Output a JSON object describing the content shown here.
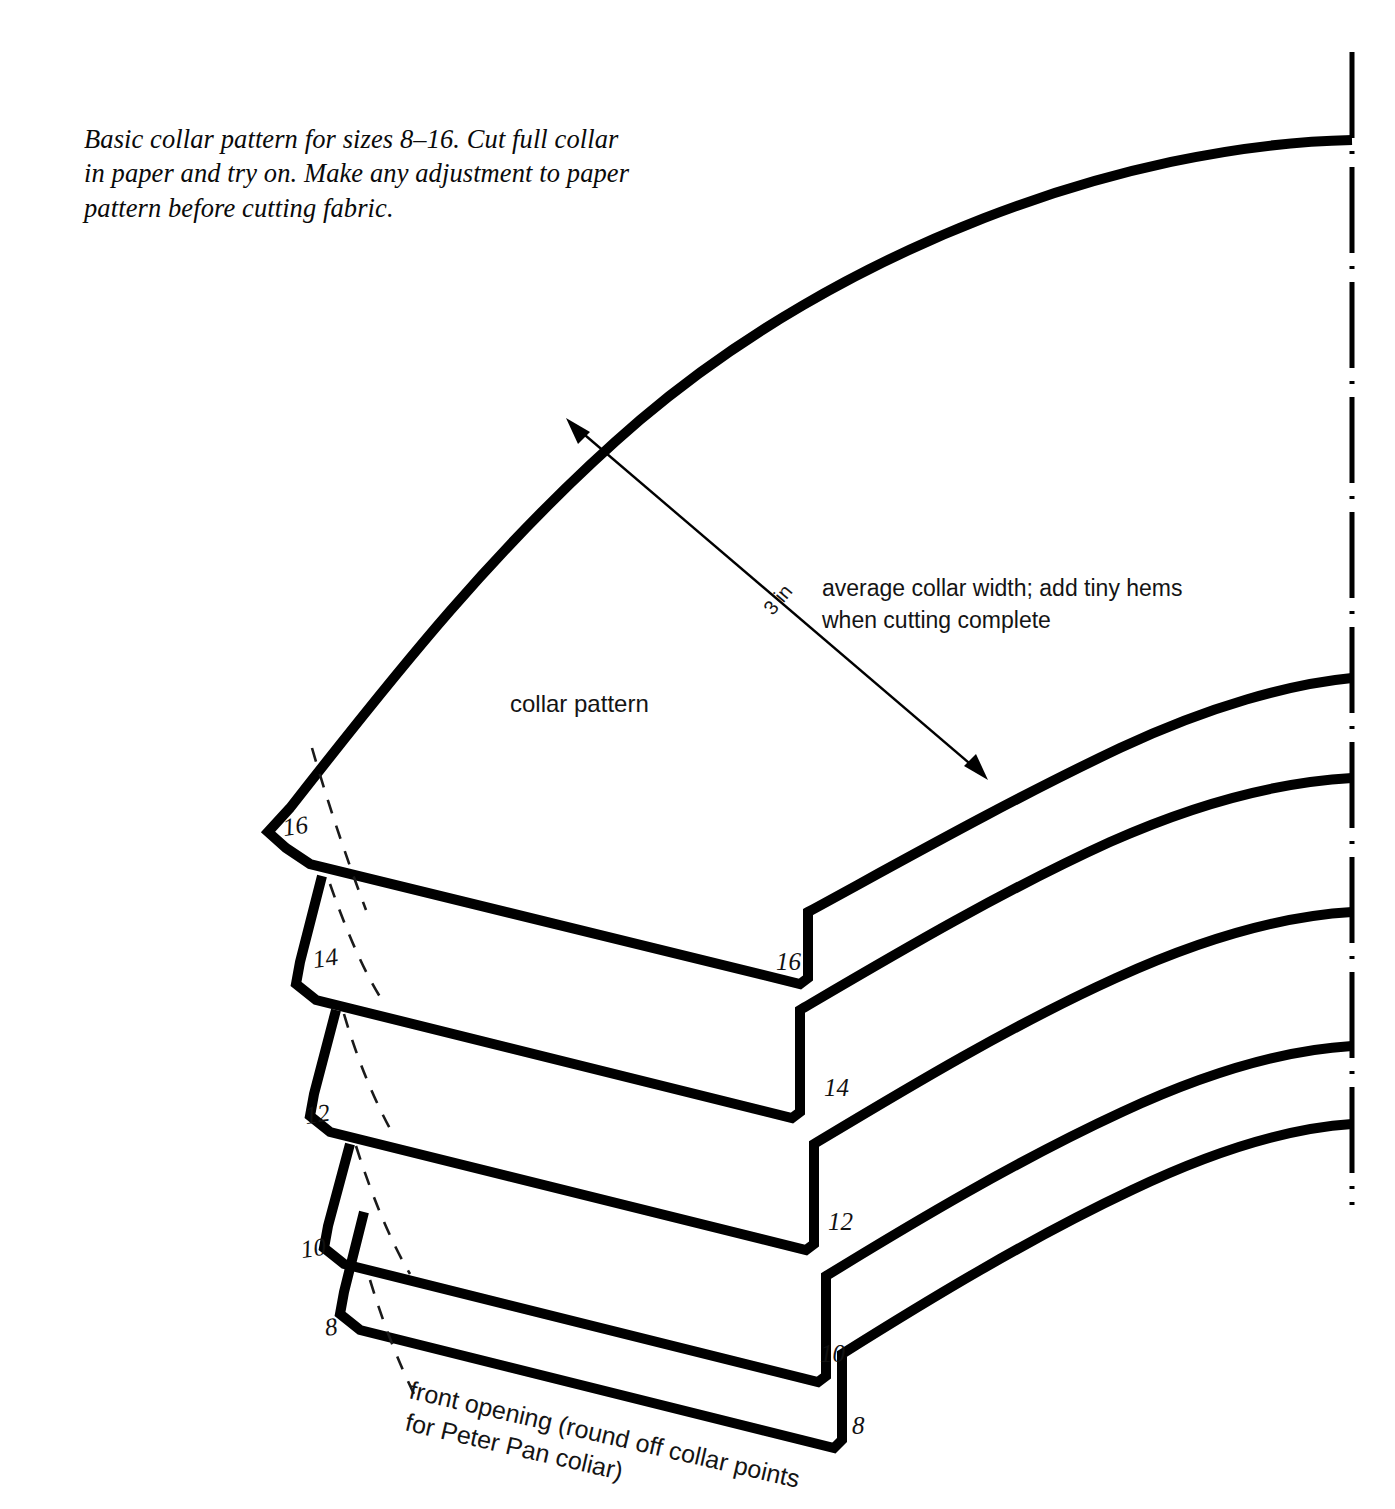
{
  "document": {
    "type": "sewing-pattern-diagram",
    "background_color": "#ffffff",
    "ink_color": "#000000"
  },
  "caption": {
    "line1": "Basic collar pattern for sizes 8–16. Cut full collar",
    "line2": "in paper and try on. Make any adjustment to paper",
    "line3": "pattern before cutting fabric."
  },
  "labels": {
    "pattern_name": "collar pattern",
    "dimension": "3 in",
    "annotation_line1": "average collar width; add tiny hems",
    "annotation_line2": "when cutting complete",
    "front_opening_line1": "front opening (round off collar points",
    "front_opening_line2": "for Peter Pan coliar)"
  },
  "sizes": {
    "range_label": "8–16",
    "values": [
      "16",
      "14",
      "12",
      "10",
      "8"
    ],
    "front_point_labels": [
      "16",
      "14",
      "12",
      "10",
      "8"
    ],
    "back_corner_labels": [
      "16",
      "14",
      "12",
      "10",
      "8"
    ]
  },
  "size_16": {
    "front_label": "16",
    "back_label": "16"
  },
  "size_14": {
    "front_label": "14",
    "back_label": "14"
  },
  "size_12": {
    "front_label": "12",
    "back_label": "12"
  },
  "size_10": {
    "front_label": "10",
    "back_label": "10"
  },
  "size_8": {
    "front_label": "8",
    "back_label": "8"
  },
  "center_fold": {
    "style": "dash-dot",
    "description": "center back fold line"
  }
}
